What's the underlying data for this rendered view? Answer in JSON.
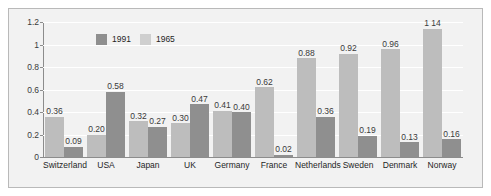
{
  "chart_data": {
    "type": "bar",
    "title": "",
    "subtitle": "",
    "xlabel": "",
    "ylabel": "",
    "ylim": [
      0,
      1.2
    ],
    "yticks": [
      "0",
      "0.2",
      "0.4",
      "0.6",
      "0.8",
      "1",
      "1.2"
    ],
    "ytick_values": [
      0,
      0.2,
      0.4,
      0.6,
      0.8,
      1,
      1.2
    ],
    "grid": true,
    "legend_position": "top-left-inside",
    "categories": [
      "Switzerland",
      "USA",
      "Japan",
      "UK",
      "Germany",
      "France",
      "Netherlands",
      "Sweden",
      "Denmark",
      "Norway"
    ],
    "series": [
      {
        "name": "1965",
        "color": "#bdbdbd",
        "values": [
          0.36,
          0.2,
          0.32,
          0.3,
          0.41,
          0.62,
          0.88,
          0.92,
          0.96,
          1.14
        ],
        "labels": [
          "0.36",
          "0.20",
          "0.32",
          "0.30",
          "0.41",
          "0.62",
          "0.88",
          "0.92",
          "0.96",
          "1 14"
        ]
      },
      {
        "name": "1991",
        "color": "#8f8f8f",
        "values": [
          0.09,
          0.58,
          0.27,
          0.47,
          0.4,
          0.02,
          0.36,
          0.19,
          0.13,
          0.16
        ],
        "labels": [
          "0.09",
          "0.58",
          "0.27",
          "0.47",
          "0.40",
          "0.02",
          "0.36",
          "0.19",
          "0.13",
          "0.16"
        ]
      }
    ],
    "legend": [
      {
        "label": "1991",
        "color": "#8f8f8f"
      },
      {
        "label": "1965",
        "color": "#cfcfcf"
      }
    ]
  },
  "colors": {
    "series_1991": "#8f8f8f",
    "series_1965": "#bdbdbd",
    "legend_1965_swatch": "#cfcfcf",
    "plot_background": "#f2f2f2",
    "gridline": "#ffffff",
    "axis": "#8c8c8c",
    "frame_border": "#b9b9b9",
    "text": "#1f1f1f"
  }
}
